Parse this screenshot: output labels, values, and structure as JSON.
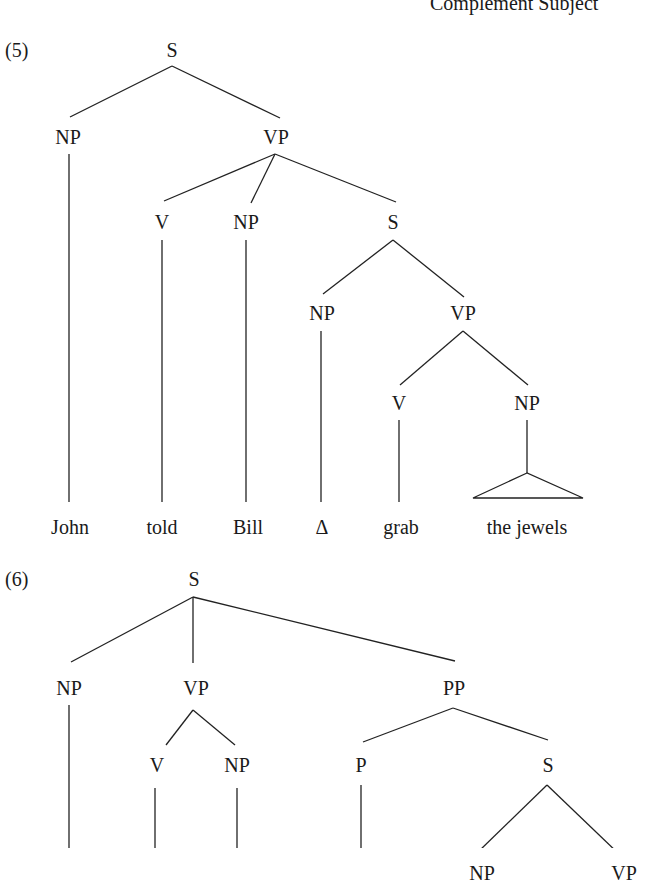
{
  "header": {
    "running_title": "Complement Subject"
  },
  "trees": [
    {
      "example_number": "(5)",
      "nodes": {
        "s_root": "S",
        "np_subj": "NP",
        "vp_main": "VP",
        "v_main": "V",
        "np_obj": "NP",
        "s_comp": "S",
        "np_comp": "NP",
        "vp_comp": "VP",
        "v_comp": "V",
        "np_comp_obj": "NP"
      },
      "leaves": [
        "John",
        "told",
        "Bill",
        "Δ",
        "grab",
        "the jewels"
      ]
    },
    {
      "example_number": "(6)",
      "nodes": {
        "s_root": "S",
        "np_subj": "NP",
        "vp_main": "VP",
        "pp": "PP",
        "v_main": "V",
        "np_obj": "NP",
        "p": "P",
        "s_comp": "S",
        "np_comp": "NP",
        "vp_comp": "VP"
      }
    }
  ]
}
